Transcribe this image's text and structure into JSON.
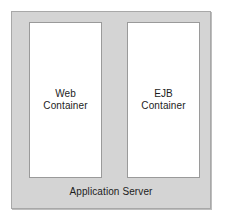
{
  "diagram": {
    "type": "block-diagram",
    "title": "Application Server",
    "background_color": "#ffffff",
    "outer": {
      "label": "Application Server",
      "fill_color": "#d4d4d4",
      "border_color": "#a8a8a8"
    },
    "containers": [
      {
        "id": "web-container",
        "label_line1": "Web",
        "label_line2": "Container",
        "fill_color": "#ffffff",
        "border_color": "#9a9a9a"
      },
      {
        "id": "ejb-container",
        "label_line1": "EJB",
        "label_line2": "Container",
        "fill_color": "#ffffff",
        "border_color": "#9a9a9a"
      }
    ]
  }
}
